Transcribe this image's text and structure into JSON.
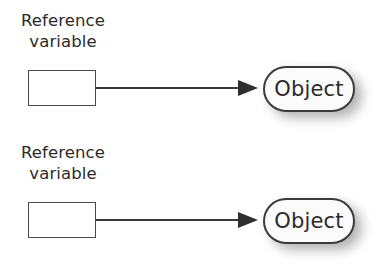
{
  "diagram": {
    "type": "reference-variable-object-diagram",
    "background_color": "#ffffff",
    "line_color": "#3a3a3a",
    "text_color": "#2b2b2b",
    "node_fill_color": "#fbfbfb",
    "shadow_color": "#9a9a9a",
    "groups": [
      {
        "label": {
          "line1": "Reference",
          "line2": "variable"
        },
        "box": {
          "value": ""
        },
        "object": {
          "label": "Object"
        }
      },
      {
        "label": {
          "line1": "Reference",
          "line2": "variable"
        },
        "box": {
          "value": ""
        },
        "object": {
          "label": "Object"
        }
      }
    ]
  }
}
